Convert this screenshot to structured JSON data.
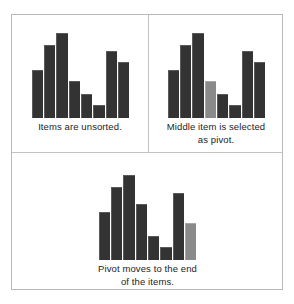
{
  "figure": {
    "colors": {
      "bar": "#333333",
      "pivot_bar": "#8a8a8a",
      "border": "#b9b9b9",
      "background": "#ffffff",
      "text": "#1d1d1d"
    }
  },
  "panels": [
    {
      "id": "unsorted",
      "caption": "Items are unsorted.",
      "caption_lines": [
        "Items are unsorted."
      ]
    },
    {
      "id": "pivot-selected",
      "caption": "Middle item is selected as pivot.",
      "caption_lines": [
        "Middle item is selected",
        "as pivot."
      ]
    },
    {
      "id": "pivot-moved",
      "caption": "Pivot moves to the end of the items.",
      "caption_lines": [
        "Pivot moves to the end",
        "of the items."
      ]
    }
  ],
  "chart_data": [
    {
      "type": "bar",
      "title": "Items are unsorted.",
      "xlabel": "",
      "ylabel": "",
      "ylim": [
        0,
        100
      ],
      "grid": false,
      "legend": null,
      "categories": [
        "1",
        "2",
        "3",
        "4",
        "5",
        "6",
        "7",
        "8"
      ],
      "values": [
        57,
        86,
        100,
        44,
        28,
        15,
        79,
        66
      ],
      "highlight_index": null,
      "colors": [
        "#333333",
        "#333333",
        "#333333",
        "#333333",
        "#333333",
        "#333333",
        "#333333",
        "#333333"
      ]
    },
    {
      "type": "bar",
      "title": "Middle item is selected as pivot.",
      "xlabel": "",
      "ylabel": "",
      "ylim": [
        0,
        100
      ],
      "grid": false,
      "legend": null,
      "categories": [
        "1",
        "2",
        "3",
        "4",
        "5",
        "6",
        "7",
        "8"
      ],
      "values": [
        57,
        86,
        100,
        44,
        28,
        15,
        79,
        66
      ],
      "highlight_index": 3,
      "colors": [
        "#333333",
        "#333333",
        "#333333",
        "#8a8a8a",
        "#333333",
        "#333333",
        "#333333",
        "#333333"
      ]
    },
    {
      "type": "bar",
      "title": "Pivot moves to the end of the items.",
      "xlabel": "",
      "ylabel": "",
      "ylim": [
        0,
        100
      ],
      "grid": false,
      "legend": null,
      "categories": [
        "1",
        "2",
        "3",
        "4",
        "5",
        "6",
        "7",
        "8"
      ],
      "values": [
        57,
        86,
        100,
        66,
        28,
        15,
        79,
        44
      ],
      "highlight_index": 7,
      "colors": [
        "#333333",
        "#333333",
        "#333333",
        "#333333",
        "#333333",
        "#333333",
        "#333333",
        "#8a8a8a"
      ]
    }
  ]
}
